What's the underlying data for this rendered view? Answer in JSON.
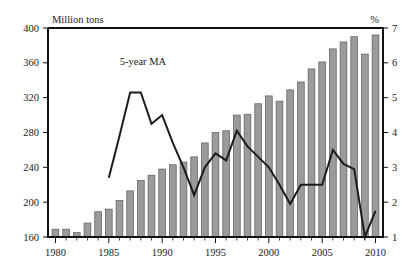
{
  "chart_data": {
    "type": "bar",
    "title": "",
    "subtitle": "",
    "xlabel": "",
    "ylabel": "Million tons",
    "y2label": "%",
    "grid": false,
    "legend_position": "inline-annotation",
    "x": [
      1980,
      1981,
      1982,
      1983,
      1984,
      1985,
      1986,
      1987,
      1988,
      1989,
      1990,
      1991,
      1992,
      1993,
      1994,
      1995,
      1996,
      1997,
      1998,
      1999,
      2000,
      2001,
      2002,
      2003,
      2004,
      2005,
      2006,
      2007,
      2008,
      2009,
      2010
    ],
    "xlim": [
      1979.3,
      2010.7
    ],
    "xticks": [
      1980,
      1985,
      1990,
      1995,
      2000,
      2005,
      2010
    ],
    "xticklabels": [
      "1980",
      "1985",
      "1990",
      "1995",
      "2000",
      "2005",
      "2010"
    ],
    "ylim": [
      160,
      400
    ],
    "yticks": [
      160,
      200,
      240,
      280,
      320,
      360,
      400
    ],
    "yticklabels": [
      "160",
      "200",
      "240",
      "280",
      "320",
      "360",
      "400"
    ],
    "y2lim": [
      1,
      7
    ],
    "y2ticks": [
      1,
      2,
      3,
      4,
      5,
      6,
      7
    ],
    "y2ticklabels": [
      "1",
      "2",
      "3",
      "4",
      "5",
      "6",
      "7"
    ],
    "series": [
      {
        "name": "Production",
        "kind": "bar",
        "axis": "left",
        "unit": "Million tons",
        "color": "#9b9b9b",
        "edge_color": "#5a5a5a",
        "values": [
          169,
          169,
          165,
          176,
          189,
          192,
          202,
          213,
          225,
          231,
          238,
          243,
          246,
          252,
          268,
          280,
          282,
          300,
          301,
          313,
          322,
          316,
          329,
          338,
          353,
          361,
          376,
          384,
          390,
          370,
          392
        ]
      },
      {
        "name": "5-year MA",
        "kind": "line",
        "axis": "right",
        "unit": "%",
        "color": "#1c1c1c",
        "x": [
          1985,
          1986,
          1987,
          1988,
          1989,
          1990,
          1991,
          1992,
          1993,
          1994,
          1995,
          1996,
          1997,
          1998,
          1999,
          2000,
          2001,
          2002,
          2003,
          2004,
          2005,
          2006,
          2007,
          2008,
          2009,
          2010
        ],
        "values": [
          2.7,
          3.9,
          5.15,
          5.15,
          4.25,
          4.5,
          3.7,
          3.0,
          2.2,
          3.0,
          3.4,
          3.2,
          4.05,
          3.6,
          3.3,
          3.0,
          2.5,
          1.95,
          2.5,
          2.5,
          2.5,
          3.5,
          3.1,
          2.95,
          1.0,
          1.75
        ]
      }
    ],
    "annotations": [
      {
        "text": "5-year MA",
        "x": 1988.2,
        "y_pct": 5.95,
        "name": "ma-series-annotation"
      }
    ]
  },
  "axes": {
    "left_unit": "Million tons",
    "right_unit": "%"
  }
}
